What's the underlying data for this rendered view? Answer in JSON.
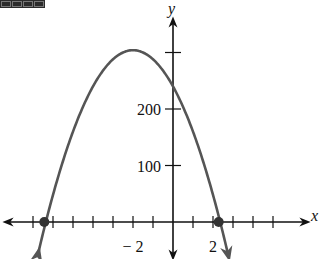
{
  "chart_data": {
    "type": "line",
    "title": "",
    "xlabel": "x",
    "ylabel": "y",
    "function": "y = -16x^2 - 64x + 240",
    "x_tick_labels": [
      {
        "value": -2,
        "label": "− 2"
      },
      {
        "value": 2,
        "label": "2"
      }
    ],
    "y_tick_labels": [
      {
        "value": 100,
        "label": "100"
      },
      {
        "value": 200,
        "label": "200"
      }
    ],
    "x_ticks": [
      -7,
      -6,
      -5,
      -4,
      -3,
      -2,
      -1,
      1,
      2,
      3,
      4,
      5
    ],
    "y_ticks": [
      100,
      200,
      300
    ],
    "xlim": [
      -8,
      6.7
    ],
    "ylim": [
      -60,
      340
    ],
    "vertex": {
      "x": -2,
      "y": 304
    },
    "y_intercept": 240,
    "roots": [
      -6.36,
      2.36
    ],
    "points_marked": [
      {
        "x": -6.36,
        "y": 0
      },
      {
        "x": 2.36,
        "y": 0
      }
    ],
    "curve_color": "#555555",
    "grid": false,
    "legend": null
  },
  "decor": {
    "badge_icon": "corner-badge-icon"
  }
}
